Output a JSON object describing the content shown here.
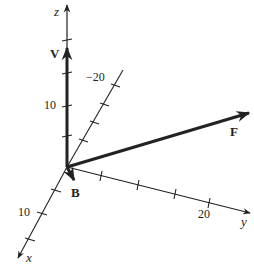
{
  "diagram": {
    "type": "3d-vector-axes",
    "colors": {
      "ink": "#222222",
      "background": "#ffffff"
    },
    "axes": {
      "z": {
        "label": "z",
        "tick_label": "10"
      },
      "x": {
        "label": "x",
        "tick_label": "10",
        "negative_tick_label": "−20"
      },
      "y": {
        "label": "y",
        "tick_label": "20"
      }
    },
    "vectors": [
      {
        "name": "V",
        "label": "V",
        "direction": "along +z"
      },
      {
        "name": "F",
        "label": "F",
        "direction": "toward +y, upward"
      },
      {
        "name": "B",
        "label": "B",
        "direction": "along +x (short)"
      }
    ]
  }
}
